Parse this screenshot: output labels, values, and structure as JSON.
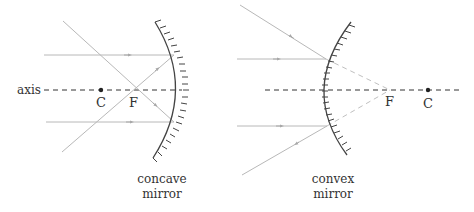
{
  "colors": {
    "ray": "#b8b8b8",
    "axis": "#333333",
    "mirror": "#444444",
    "text": "#333333"
  },
  "concave": {
    "axis_label": "axis",
    "center_label": "C",
    "focus_label": "F",
    "caption_line1": "concave",
    "caption_line2": "mirror"
  },
  "convex": {
    "center_label": "C",
    "focus_label": "F",
    "caption_line1": "convex",
    "caption_line2": "mirror"
  }
}
